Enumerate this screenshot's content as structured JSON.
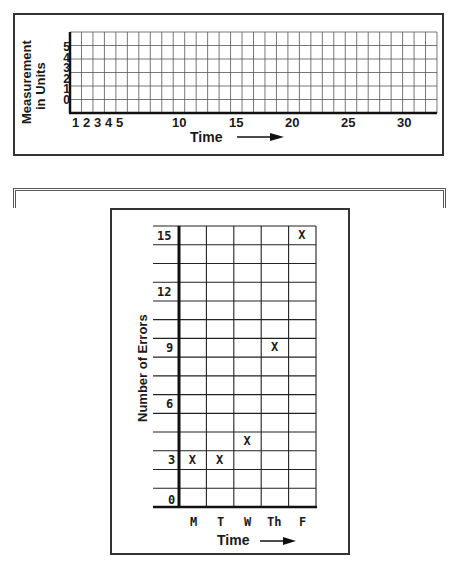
{
  "chart_data": [
    {
      "type": "line",
      "title": "",
      "xlabel": "Time",
      "ylabel": "Measurement in Units",
      "x_ticks": [
        "1",
        "2",
        "3",
        "4",
        "5",
        "10",
        "15",
        "20",
        "25",
        "30"
      ],
      "y_ticks": [
        "0",
        "1",
        "2",
        "3",
        "4",
        "5"
      ],
      "xlim": [
        0,
        32
      ],
      "ylim": [
        0,
        6
      ],
      "grid": true,
      "x_arrow": true,
      "series": []
    },
    {
      "type": "scatter",
      "title": "",
      "xlabel": "Time",
      "ylabel": "Number of Errors",
      "categories": [
        "M",
        "T",
        "W",
        "Th",
        "F"
      ],
      "y_ticks": [
        "0",
        "3",
        "6",
        "9",
        "12",
        "15"
      ],
      "ylim": [
        0,
        15
      ],
      "grid": true,
      "marker": "X",
      "x_arrow": true,
      "series": [
        {
          "name": "Errors",
          "values": [
            3,
            3,
            4,
            9,
            15
          ]
        }
      ]
    }
  ],
  "top_chart": {
    "ylabel_line1": "Measurement",
    "ylabel_line2": "in Units",
    "xlabel": "Time",
    "y_ticks": [
      "0",
      "1",
      "2",
      "3",
      "4",
      "5"
    ],
    "x_ticks_small": [
      "1",
      "2",
      "3",
      "4",
      "5"
    ],
    "x_ticks_large": [
      "10",
      "15",
      "20",
      "25",
      "30"
    ]
  },
  "bottom_chart": {
    "ylabel": "Number of Errors",
    "xlabel": "Time",
    "y_ticks": [
      "15",
      "12",
      "9",
      "6",
      "3",
      "0"
    ],
    "days": [
      "M",
      "T",
      "W",
      "Th",
      "F"
    ],
    "marker": "X"
  }
}
